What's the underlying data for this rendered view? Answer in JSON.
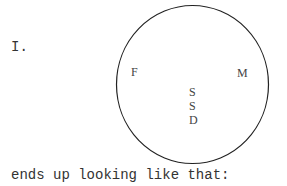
{
  "section_label": "I.",
  "diagram": {
    "shape": "circle",
    "labels": {
      "left": "F",
      "right": "M",
      "center": [
        "S",
        "S",
        "D"
      ]
    }
  },
  "caption": "ends up looking like that:"
}
